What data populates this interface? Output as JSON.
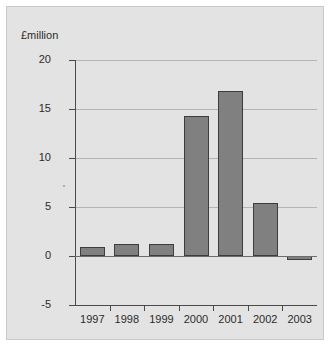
{
  "chart_data": {
    "type": "bar",
    "title": "",
    "subtitle": "",
    "xlabel": "",
    "ylabel": "£million",
    "categories": [
      "1997",
      "1998",
      "1999",
      "2000",
      "2001",
      "2002",
      "2003"
    ],
    "values": [
      0.9,
      1.2,
      1.2,
      14.3,
      16.8,
      5.4,
      -0.3
    ],
    "series": [
      {
        "name": "",
        "values": [
          0.9,
          1.2,
          1.2,
          14.3,
          16.8,
          5.4,
          -0.3
        ]
      }
    ],
    "ylim": [
      -5,
      20
    ],
    "yticks": [
      20,
      15,
      10,
      5,
      0,
      -5
    ],
    "ytick_labels": [
      "20",
      "15",
      "10",
      "5",
      "0",
      "-5"
    ],
    "grid": true,
    "legend": false,
    "legend_position": "none",
    "bar_color": "#808080",
    "bar_edge_color": "#3d3d3d",
    "panel_color": "#e3e3e3",
    "grid_color": "#b4b4b4",
    "axis_color": "#4a4a4a"
  }
}
